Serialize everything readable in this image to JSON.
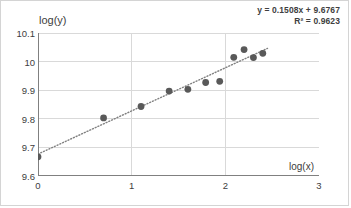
{
  "chart_data": {
    "type": "scatter",
    "title": "",
    "xlabel": "log(x)",
    "ylabel": "log(y)",
    "xlim": [
      0,
      3
    ],
    "ylim": [
      9.6,
      10.1
    ],
    "xticks": [
      "0",
      "1",
      "2",
      "3"
    ],
    "xtick_values": [
      0,
      1,
      2,
      3
    ],
    "yticks": [
      "9.6",
      "9.7",
      "9.8",
      "9.9",
      "10",
      "10.1"
    ],
    "ytick_values": [
      9.6,
      9.7,
      9.8,
      9.9,
      10.0,
      10.1
    ],
    "grid": "horizontal-and-vertical",
    "legend": "none",
    "marker_color": "#595959",
    "trendline_color": "#808080",
    "trendline_style": "dotted",
    "gridline_color": "#d9d9d9",
    "axis_color": "#808080",
    "points": [
      {
        "x": 0.0,
        "y": 9.667
      },
      {
        "x": 0.7,
        "y": 9.803
      },
      {
        "x": 1.1,
        "y": 9.843
      },
      {
        "x": 1.4,
        "y": 9.897
      },
      {
        "x": 1.6,
        "y": 9.903
      },
      {
        "x": 1.79,
        "y": 9.927
      },
      {
        "x": 1.94,
        "y": 9.931
      },
      {
        "x": 2.09,
        "y": 10.015
      },
      {
        "x": 2.2,
        "y": 10.042
      },
      {
        "x": 2.3,
        "y": 10.014
      },
      {
        "x": 2.4,
        "y": 10.029
      }
    ],
    "trendline": {
      "slope": 0.1508,
      "intercept": 9.6767,
      "r_squared": 0.9623,
      "equation_label": "y = 0.1508x + 9.6767",
      "r2_label": "R² = 0.9623",
      "x_start": 0.0,
      "x_end": 2.45
    }
  },
  "annotations": {
    "equation": "y = 0.1508x + 9.6767",
    "r_squared": "R² = 0.9623"
  },
  "axes": {
    "y_title": "log(y)",
    "x_title": "log(x)"
  }
}
